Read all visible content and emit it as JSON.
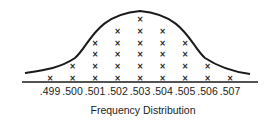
{
  "chart_data": {
    "type": "scatter",
    "subtype": "dot-plot-with-normal-curve",
    "title": "Frequency Distribution",
    "xlabel": "",
    "ylabel": "",
    "categories": [
      ".499",
      ".500",
      ".501",
      ".502",
      ".503",
      ".504",
      ".505",
      ".506",
      ".507"
    ],
    "values": [
      1,
      2,
      4,
      5,
      6,
      5,
      4,
      2,
      1
    ],
    "marker": "×",
    "overlay": "bell curve (normal distribution)",
    "grid": false,
    "legend": null
  }
}
